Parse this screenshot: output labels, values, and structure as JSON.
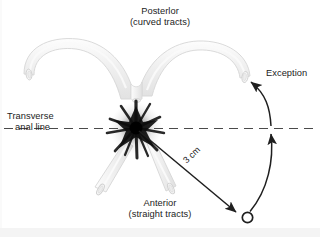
{
  "figure": {
    "title_alt": "Anal fistula tract orientation relative to the transverse anal line",
    "background_color": "#ffffff",
    "text_color": "#232323",
    "tract_fill_color": "#f2f2f2",
    "tract_stroke_color": "#d8d8d8",
    "starburst_color": "#1a1a1a",
    "width": 320,
    "height": 237
  },
  "labels": {
    "posterior": {
      "line1": "Posterlor",
      "line2": "(curved tracts)"
    },
    "anterior": {
      "line1": "Anterior",
      "line2": "(straight tracts)"
    },
    "transverse": {
      "line1": "Transverse",
      "line2": "anal line"
    },
    "exception": "Exception",
    "measurement": "3 cm"
  },
  "elements": {
    "dashed_line_name": "transverse-anal-line",
    "starburst_name": "anal-opening-starburst",
    "posterior_tract_left": "posterior-curved-tract-left",
    "posterior_tract_right": "posterior-curved-tract-right",
    "anterior_tract_left": "anterior-straight-tract-left",
    "anterior_tract_right": "anterior-straight-tract-right",
    "measurement_arrow": "three-cm-measurement-arrow",
    "external_opening": "external-opening-circle",
    "exception_arrow": "exception-curved-arrow"
  }
}
